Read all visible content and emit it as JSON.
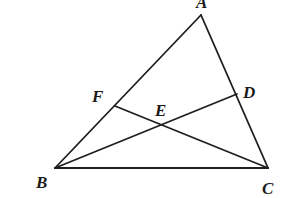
{
  "figure": {
    "type": "triangle-with-cevians",
    "points": [
      {
        "id": "A",
        "label": "A"
      },
      {
        "id": "B",
        "label": "B"
      },
      {
        "id": "C",
        "label": "C"
      },
      {
        "id": "D",
        "label": "D",
        "on_segment": "AC"
      },
      {
        "id": "E",
        "label": "E",
        "intersection_of": [
          "BD",
          "CF"
        ]
      },
      {
        "id": "F",
        "label": "F",
        "on_segment": "AB"
      }
    ],
    "segments": [
      {
        "id": "AB",
        "from": "A",
        "to": "B"
      },
      {
        "id": "AC",
        "from": "A",
        "to": "C"
      },
      {
        "id": "BC",
        "from": "B",
        "to": "C"
      },
      {
        "id": "BD",
        "from": "B",
        "to": "D"
      },
      {
        "id": "CF",
        "from": "C",
        "to": "F"
      }
    ],
    "colors": {
      "line": "#1e1e1e",
      "label": "#1a1a1a",
      "background": "#ffffff"
    }
  }
}
